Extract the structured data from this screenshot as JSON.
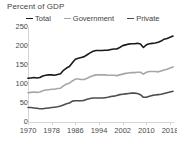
{
  "chart_data": {
    "type": "line",
    "title": "Percent of GDP",
    "xlabel": "",
    "ylabel": "",
    "xlim": [
      1970,
      2019
    ],
    "ylim": [
      0,
      250
    ],
    "yticks": [
      0,
      50,
      100,
      150,
      200,
      250
    ],
    "xticks": [
      1970,
      1978,
      1986,
      1994,
      2002,
      2010,
      2018
    ],
    "grid": false,
    "legend_position": "top",
    "x": [
      1970,
      1971,
      1972,
      1973,
      1974,
      1975,
      1976,
      1977,
      1978,
      1979,
      1980,
      1981,
      1982,
      1983,
      1984,
      1985,
      1986,
      1987,
      1988,
      1989,
      1990,
      1991,
      1992,
      1993,
      1994,
      1995,
      1996,
      1997,
      1998,
      1999,
      2000,
      2001,
      2002,
      2003,
      2004,
      2005,
      2006,
      2007,
      2008,
      2009,
      2010,
      2011,
      2012,
      2013,
      2014,
      2015,
      2016,
      2017,
      2018,
      2019
    ],
    "series": [
      {
        "name": "Total",
        "color": "#1a1a1a",
        "values": [
          115,
          116,
          117,
          116,
          117,
          121,
          123,
          124,
          124,
          123,
          125,
          127,
          136,
          142,
          146,
          156,
          165,
          168,
          170,
          172,
          177,
          182,
          186,
          188,
          188,
          188,
          189,
          189,
          191,
          192,
          192,
          196,
          201,
          203,
          205,
          206,
          206,
          207,
          205,
          196,
          203,
          206,
          207,
          208,
          210,
          213,
          218,
          220,
          223,
          226
        ]
      },
      {
        "name": "Government",
        "color": "#a6a6a6",
        "values": [
          77,
          78,
          79,
          78,
          79,
          82,
          84,
          85,
          86,
          86,
          88,
          89,
          95,
          100,
          102,
          108,
          113,
          113,
          112,
          112,
          115,
          119,
          122,
          124,
          124,
          124,
          124,
          123,
          123,
          123,
          122,
          124,
          126,
          128,
          129,
          130,
          130,
          131,
          131,
          126,
          131,
          133,
          133,
          133,
          132,
          134,
          137,
          139,
          142,
          145
        ]
      },
      {
        "name": "Private",
        "color": "#4d4d4d",
        "values": [
          38,
          38,
          37,
          36,
          35,
          35,
          36,
          37,
          38,
          39,
          40,
          42,
          45,
          48,
          50,
          55,
          56,
          56,
          56,
          57,
          60,
          62,
          63,
          63,
          63,
          63,
          64,
          65,
          67,
          68,
          70,
          72,
          73,
          74,
          75,
          76,
          76,
          75,
          72,
          65,
          65,
          68,
          70,
          71,
          72,
          73,
          75,
          77,
          79,
          81
        ]
      }
    ]
  }
}
